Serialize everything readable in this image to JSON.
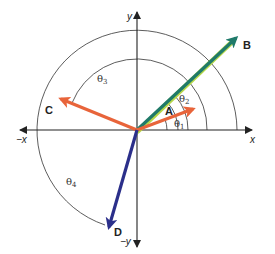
{
  "diagram": {
    "type": "vector-angle-diagram",
    "origin": {
      "x": 137,
      "y": 130
    },
    "axes": {
      "x_pos_label": "x",
      "x_neg_label": "−x",
      "y_pos_label": "y",
      "y_neg_label": "−y",
      "color": "#222222"
    },
    "vectors": [
      {
        "name": "A",
        "label": "A",
        "color": "#e8643a",
        "end": {
          "x": 197,
          "y": 107
        },
        "label_pos": {
          "x": 168,
          "y": 112
        }
      },
      {
        "name": "B",
        "label": "B",
        "color": "#1f7a6a",
        "highlight": "#b6d84a",
        "end": {
          "x": 240,
          "y": 35
        },
        "label_pos": {
          "x": 243,
          "y": 49
        }
      },
      {
        "name": "C",
        "label": "C",
        "color": "#e8643a",
        "end": {
          "x": 56,
          "y": 97
        },
        "label_pos": {
          "x": 46,
          "y": 113
        }
      },
      {
        "name": "D",
        "label": "D",
        "color": "#2b2f8a",
        "end": {
          "x": 107,
          "y": 232
        },
        "label_pos": {
          "x": 113,
          "y": 234
        }
      }
    ],
    "angles": [
      {
        "name": "theta1",
        "symbol": "θ",
        "subscript": "1",
        "radius": 30,
        "label_pos": {
          "x": 176,
          "y": 125
        }
      },
      {
        "name": "theta2",
        "symbol": "θ",
        "subscript": "2",
        "radius": 41,
        "label_pos": {
          "x": 180,
          "y": 100
        }
      },
      {
        "name": "theta3",
        "symbol": "θ",
        "subscript": "3",
        "radius": 70,
        "label_pos": {
          "x": 98,
          "y": 80
        }
      },
      {
        "name": "theta4",
        "symbol": "θ",
        "subscript": "4",
        "radius": 100,
        "label_pos": {
          "x": 66,
          "y": 184
        }
      }
    ]
  }
}
